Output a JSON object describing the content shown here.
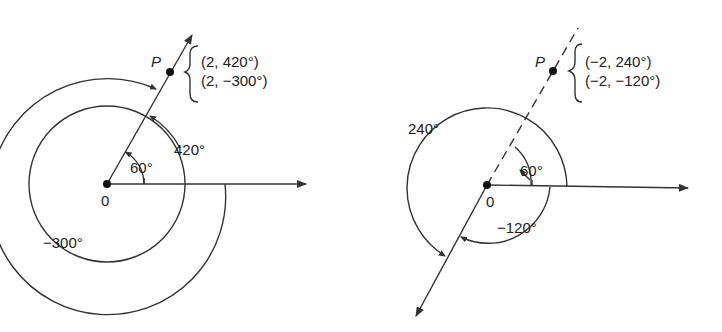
{
  "figures": [
    {
      "id": "left",
      "origin_label": "0",
      "point_label": "P",
      "coordinates": [
        "(2, 420°)",
        "(2, −300°)"
      ],
      "angles": [
        {
          "label": "60°",
          "value": 60
        },
        {
          "label": "420°",
          "value": 420
        },
        {
          "label": "−300°",
          "value": -300
        }
      ],
      "ray_style": "solid"
    },
    {
      "id": "right",
      "origin_label": "0",
      "point_label": "P",
      "coordinates": [
        "(−2, 240°)",
        "(−2, −120°)"
      ],
      "angles": [
        {
          "label": "60°",
          "value": 60
        },
        {
          "label": "240°",
          "value": 240
        },
        {
          "label": "−120°",
          "value": -120
        }
      ],
      "ray_style": "dashed"
    }
  ],
  "colors": {
    "ink": "#333333",
    "background": "#ffffff"
  }
}
